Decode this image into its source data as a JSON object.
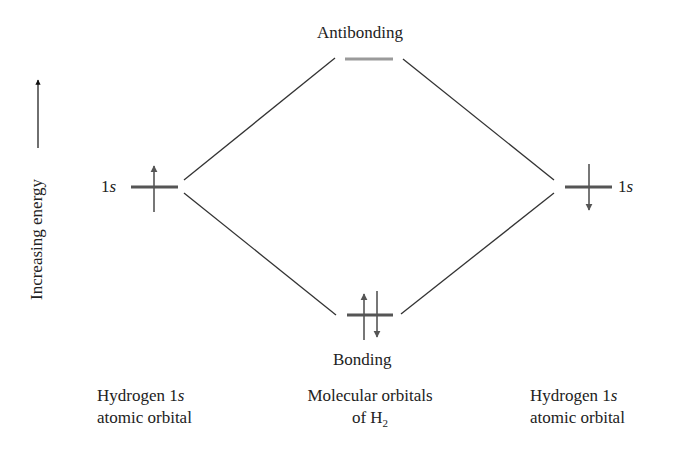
{
  "diagram": {
    "type": "molecular-orbital-diagram",
    "axis": {
      "label": "Increasing energy",
      "direction": "up"
    },
    "levels": {
      "left_atomic": {
        "label_prefix": "1",
        "label_italic": "s",
        "electrons": [
          "up"
        ]
      },
      "right_atomic": {
        "label_prefix": "1",
        "label_italic": "s",
        "electrons": [
          "down"
        ]
      },
      "antibonding": {
        "label": "Antibonding",
        "electrons": []
      },
      "bonding": {
        "label": "Bonding",
        "electrons": [
          "up",
          "down"
        ]
      }
    },
    "captions": {
      "left": {
        "line1_prefix": "Hydrogen 1",
        "line1_italic": "s",
        "line2": "atomic orbital"
      },
      "center": {
        "line1": "Molecular orbitals",
        "line2_prefix": "of H",
        "line2_sub": "2"
      },
      "right": {
        "line1_prefix": "Hydrogen 1",
        "line1_italic": "s",
        "line2": "atomic orbital"
      }
    },
    "colors": {
      "level_line": "#555555",
      "antibonding_line": "#9a9a9a",
      "connector": "#333333",
      "arrow": "#555555",
      "text": "#222222"
    }
  }
}
